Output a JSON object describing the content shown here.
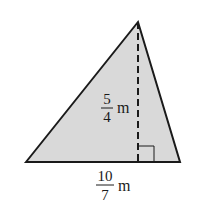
{
  "diagram": {
    "type": "triangle-with-altitude",
    "fill_color": "#d9d9d9",
    "stroke_color": "#1a1a1a",
    "vertices": {
      "apex": [
        138,
        22
      ],
      "base_left": [
        26,
        162
      ],
      "base_right": [
        180,
        162
      ]
    },
    "height_label": {
      "numerator": "5",
      "denominator": "4",
      "unit": "m"
    },
    "base_label": {
      "numerator": "10",
      "denominator": "7",
      "unit": "m"
    },
    "right_angle_marker": true,
    "altitude_style": "dashed"
  }
}
